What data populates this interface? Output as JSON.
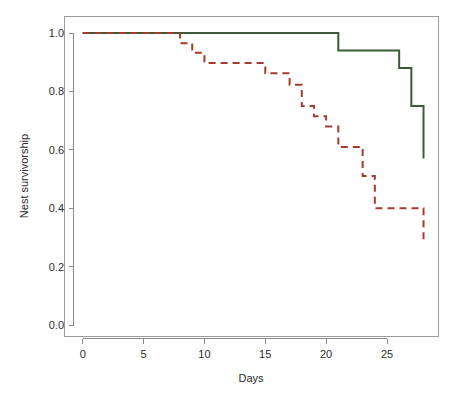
{
  "chart_data": {
    "type": "line",
    "title": "",
    "xlabel": "Days",
    "ylabel": "Nest survivorship",
    "xlim": [
      -1.2,
      29.2
    ],
    "ylim": [
      -0.04,
      1.04
    ],
    "xticks": [
      0,
      5,
      10,
      15,
      20,
      25
    ],
    "xtick_labels": [
      "0",
      "5",
      "10",
      "15",
      "20",
      "25"
    ],
    "yticks": [
      0.0,
      0.2,
      0.4,
      0.6,
      0.8,
      1.0
    ],
    "ytick_labels": [
      "0.0",
      "0.2",
      "0.4",
      "0.6",
      "0.8",
      "1.0"
    ],
    "grid": false,
    "legend": "none",
    "step_type": "post",
    "series": [
      {
        "name": "green-solid-group",
        "style": "solid",
        "color": "#3A5B36",
        "line_width": 2,
        "x": [
          0,
          18,
          21,
          26,
          27,
          28
        ],
        "values": [
          1.0,
          1.0,
          0.94,
          0.88,
          0.75,
          0.57
        ]
      },
      {
        "name": "red-dashed-group",
        "style": "dashed",
        "color": "#A33B2E",
        "line_width": 2,
        "dash_pattern": "7 5",
        "x": [
          0,
          7,
          8,
          9,
          10,
          15,
          16,
          17,
          18,
          19,
          20,
          21,
          22,
          23,
          24,
          28
        ],
        "values": [
          1.0,
          1.0,
          0.965,
          0.932,
          0.897,
          0.862,
          0.862,
          0.823,
          0.75,
          0.715,
          0.68,
          0.61,
          0.61,
          0.51,
          0.4,
          0.29
        ]
      }
    ]
  },
  "axes": {
    "x_axis_name": "days-axis",
    "y_axis_name": "nest-survivorship-axis"
  },
  "colors": {
    "green": "#3A5B36",
    "red": "#A33B2E",
    "axis": "#8a8a8a",
    "text": "#2b2b2b",
    "background": "#ffffff"
  }
}
